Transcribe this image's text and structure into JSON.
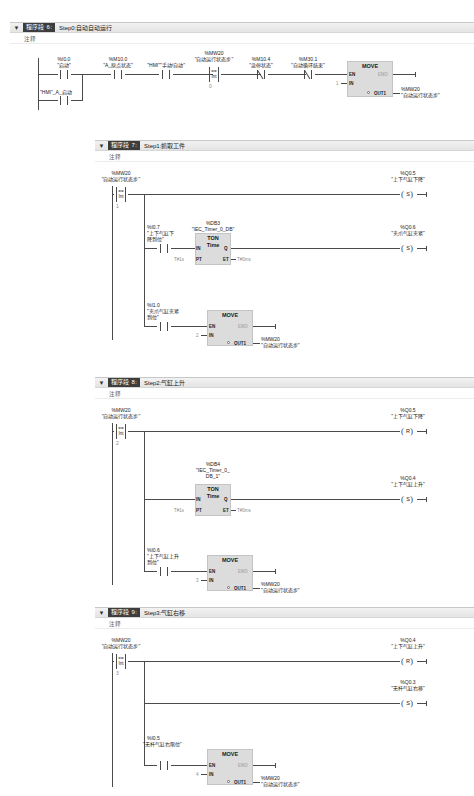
{
  "editor": {
    "language": "LAD",
    "networks": [
      {
        "id": "nw6",
        "tag_label": "程序段",
        "number": "6",
        "colon": ":",
        "title": "Step0:自动自动运行",
        "comment": "注释",
        "collapse_icon": "chevron-down-icon",
        "elements": {
          "c1_addr": "%I0.0",
          "c1_name": "\"启动\"",
          "c2_addr": "%M10.0",
          "c2_name": "\"A_原点状态\"",
          "c3_addr": "\"HMI\"",
          "c3_name": "\"手动/自动\"",
          "c4_addr": "%MW20",
          "c4_name": "\"自动运行状态步\"",
          "c4_op1": "==",
          "c4_op2": "Int",
          "c4_val": "0",
          "c5_addr": "%M10.4",
          "c5_name": "\"急停状态\"",
          "c6_addr": "%M30.1",
          "c6_name": "\"自动循环结束\"",
          "branch_addr": "\"HMI\"_A_启动",
          "move_title": "MOVE",
          "move_en": "EN",
          "move_eno": "ENO",
          "move_in": "IN",
          "move_in_val": "1",
          "move_out": "OUT1",
          "move_out_addr": "%MW20",
          "move_out_name": "\"自动运行状态步\""
        }
      },
      {
        "id": "nw7",
        "tag_label": "程序段",
        "number": "7",
        "colon": ":",
        "title": "Step1:抓取工件",
        "comment": "注释",
        "collapse_icon": "chevron-down-icon",
        "elements": {
          "c1_addr": "%MW20",
          "c1_name": "\"自动运行状态步\"",
          "c1_op1": "==",
          "c1_op2": "Int",
          "c1_val": "1",
          "coil1_addr": "%Q0.5",
          "coil1_name": "\"上下气缸下降\"",
          "coil1_type": "S",
          "c2_addr": "%I0.7",
          "c2_name": "\"上下气缸下降到位\"",
          "timer_db": "%DB3",
          "timer_db_name": "\"IEC_Timer_0_DB\"",
          "timer_title": "TON",
          "timer_sub": "Time",
          "timer_in": "IN",
          "timer_q": "Q",
          "timer_pt": "PT",
          "timer_et": "ET",
          "timer_pt_val": "T#1s",
          "timer_et_val": "T#0ms",
          "coil2_addr": "%Q0.6",
          "coil2_name": "\"夹爪气缸夹紧\"",
          "coil2_type": "S",
          "c3_addr": "%I1.0",
          "c3_name": "\"夹爪气缸夹紧到位\"",
          "move_title": "MOVE",
          "move_en": "EN",
          "move_eno": "ENO",
          "move_in": "IN",
          "move_in_val": "2",
          "move_out": "OUT1",
          "move_out_addr": "%MW20",
          "move_out_name": "\"自动运行状态步\""
        }
      },
      {
        "id": "nw8",
        "tag_label": "程序段",
        "number": "8",
        "colon": ":",
        "title": "Step2:气缸上升",
        "comment": "注释",
        "collapse_icon": "chevron-down-icon",
        "elements": {
          "c1_addr": "%MW20",
          "c1_name": "\"自动运行状态步\"",
          "c1_op1": "==",
          "c1_op2": "Int",
          "c1_val": "2",
          "coil1_addr": "%Q0.5",
          "coil1_name": "\"上下气缸下降\"",
          "coil1_type": "R",
          "timer_db": "%DB4",
          "timer_db_name1": "\"IEC_Timer_0_",
          "timer_db_name2": "DB_1\"",
          "timer_title": "TON",
          "timer_sub": "Time",
          "timer_in": "IN",
          "timer_q": "Q",
          "timer_pt": "PT",
          "timer_et": "ET",
          "timer_pt_val": "T#1s",
          "timer_et_val": "T#0ms",
          "coil2_addr": "%Q0.4",
          "coil2_name": "\"上下气缸上升\"",
          "coil2_type": "S",
          "c2_addr": "%I0.6",
          "c2_name": "\"上下气缸上升到位\"",
          "move_title": "MOVE",
          "move_en": "EN",
          "move_eno": "ENO",
          "move_in": "IN",
          "move_in_val": "3",
          "move_out": "OUT1",
          "move_out_addr": "%MW20",
          "move_out_name": "\"自动运行状态步\""
        }
      },
      {
        "id": "nw9",
        "tag_label": "程序段",
        "number": "9",
        "colon": ":",
        "title": "Step3:气缸右移",
        "comment": "注释",
        "collapse_icon": "chevron-down-icon",
        "elements": {
          "c1_addr": "%MW20",
          "c1_name": "\"自动运行状态步\"",
          "c1_op1": "==",
          "c1_op2": "Int",
          "c1_val": "3",
          "coil1_addr": "%Q0.4",
          "coil1_name": "\"上下气缸上升\"",
          "coil1_type": "R",
          "coil2_addr": "%Q0.3",
          "coil2_name": "\"无杆气缸右移\"",
          "coil2_type": "S",
          "c2_addr": "%I0.5",
          "c2_name": "\"无杆气缸右限位\"",
          "move_title": "MOVE",
          "move_en": "EN",
          "move_eno": "ENO",
          "move_in": "IN",
          "move_in_val": "4",
          "move_out": "OUT1",
          "move_out_addr": "%MW20",
          "move_out_name": "\"自动运行状态步\""
        }
      }
    ]
  }
}
